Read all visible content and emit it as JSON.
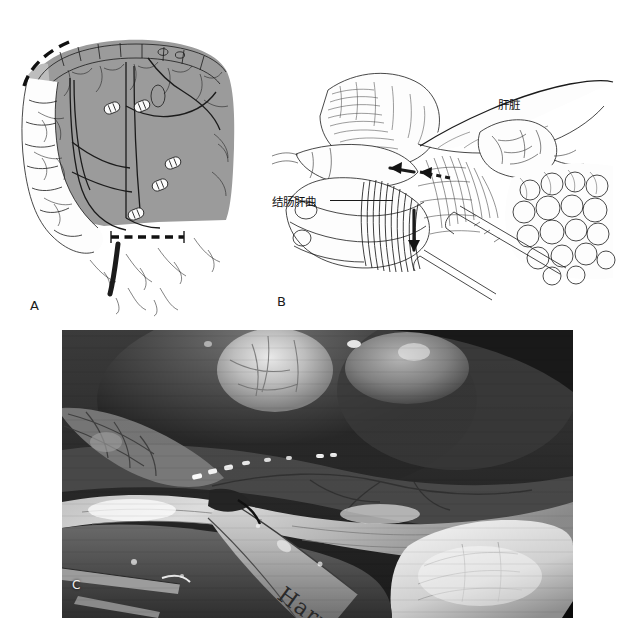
{
  "figure": {
    "type": "medical-surgical-illustration",
    "panels": [
      {
        "id": "A",
        "letter": "A",
        "kind": "line-drawing",
        "description": "Schematic of the colon showing the extent of right hemicolectomy: the shaded gray area marks the mesentery and bowel segment to be resected, white oval double-bar markers indicate vessel clips, and the heavy black dashed lines mark the proximal and distal bowel transection levels.",
        "annotations": [
          {
            "name": "proximal-transection-line",
            "style": "thick-black-dashed",
            "location": "upper-left over transverse colon"
          },
          {
            "name": "distal-transection-line",
            "style": "thick-black-dashed",
            "location": "lower-middle over terminal ileum / colon"
          },
          {
            "name": "vessel-clip",
            "style": "white-oval-with-two-bars",
            "count": 5
          }
        ],
        "colors": {
          "resection_shading": "#9b9b9b",
          "light_shading": "#bdbdbd",
          "ink": "#1b1b1b",
          "clip_fill": "#fbfbfb"
        }
      },
      {
        "id": "B",
        "letter": "B",
        "kind": "line-drawing",
        "description": "Operative view of the right upper quadrant during mobilization of the hepatic flexure. The liver and gallbladder lie superiorly, the hepatic flexure of the colon is retracted inferomedially, and greater omentum / omental fat fills the right side. Black arrows show the direction of traction and counter-traction on the hepatocolic attachments.",
        "labels": [
          {
            "name": "liver-label",
            "text": "肝脏",
            "pointsTo": "liver edge, upper right"
          },
          {
            "name": "hepatic-flexure-label",
            "text": "结肠肝曲",
            "pointsTo": "hepatic flexure of colon, left of centre",
            "leader": true
          }
        ],
        "annotations": [
          {
            "name": "traction-arrow-left",
            "style": "solid-black-arrow",
            "direction": "left"
          },
          {
            "name": "traction-arrow-dashed",
            "style": "black-dashed-arrow",
            "direction": "left"
          },
          {
            "name": "traction-arrow-down",
            "style": "solid-black-arrow",
            "direction": "down"
          }
        ]
      },
      {
        "id": "C",
        "letter": "C",
        "kind": "photograph",
        "description": "Intra-operative laparoscopic photograph (grayscale) of the same step. The liver and gallbladder occupy the upper field, a white avascular plane is being developed across the centre, and an ultrasonic dissector enters from the lower left. A row of small metallic surgical clips is visible across the middle of the field.",
        "instrument_text": "Harm",
        "instrument_name": "ultrasonic-dissector",
        "annotations": [
          {
            "name": "surgical-clip-row",
            "style": "bright-metallic-specks",
            "location": "mid-field, horizontal"
          },
          {
            "name": "corner-marker",
            "style": "black-triangle",
            "location": "bottom-right corner"
          }
        ]
      }
    ]
  }
}
